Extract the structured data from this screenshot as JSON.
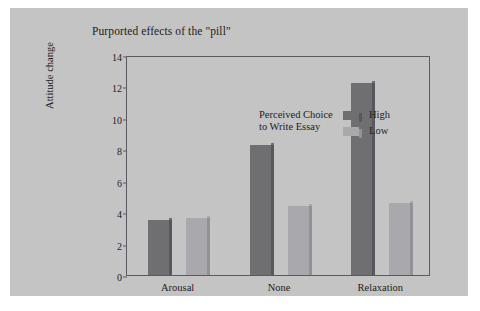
{
  "chart_data": {
    "type": "bar",
    "title": "Purported effects of the \"pill\"",
    "xlabel": "",
    "ylabel": "Attitude change",
    "categories": [
      "Arousal",
      "None",
      "Relaxation"
    ],
    "series": [
      {
        "name": "High",
        "color": "#6f6f72",
        "values": [
          3.5,
          8.3,
          12.2
        ]
      },
      {
        "name": "Low",
        "color": "#a9a9ad",
        "values": [
          3.6,
          4.4,
          4.6
        ]
      }
    ],
    "ylim": [
      0,
      14
    ],
    "yticks": [
      0,
      2,
      4,
      6,
      8,
      10,
      12,
      14
    ],
    "ytick_labels": [
      "0",
      "2",
      "4",
      "6",
      "8",
      "10",
      "12",
      "14"
    ],
    "grid": false,
    "legend_position": "upper-left-inside",
    "legend_caption_line1": "Perceived Choice",
    "legend_caption_line2": "to Write Essay",
    "background_color": "#c4c4c4",
    "frame_color": "#5a5a62"
  }
}
